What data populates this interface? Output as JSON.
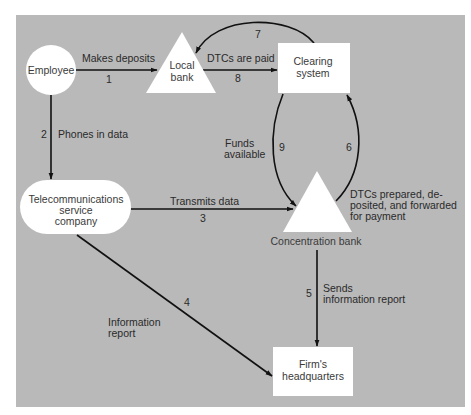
{
  "colors": {
    "panel": "#b9b9b9",
    "node_fill": "#ffffff",
    "line": "#111111",
    "text": "#2a2a2a"
  },
  "nodes": {
    "employee": {
      "label": "Employee",
      "shape": "circle"
    },
    "local_bank": {
      "label_line1": "Local",
      "label_line2": "bank",
      "shape": "triangle"
    },
    "clearing_system": {
      "label_line1": "Clearing",
      "label_line2": "system",
      "shape": "rectangle"
    },
    "telecom": {
      "label_line1": "Telecommunications",
      "label_line2": "service",
      "label_line3": "company",
      "shape": "rounded-ellipse"
    },
    "concentration_bank": {
      "label": "Concentration bank",
      "shape": "triangle"
    },
    "headquarters": {
      "label_line1": "Firm's",
      "label_line2": "headquarters",
      "shape": "rectangle"
    }
  },
  "edges": [
    {
      "id": "1",
      "number": "1",
      "from": "Employee",
      "to": "Local bank",
      "label": "Makes deposits"
    },
    {
      "id": "2",
      "number": "2",
      "from": "Employee",
      "to": "Telecommunications service company",
      "label": "Phones in data"
    },
    {
      "id": "3",
      "number": "3",
      "from": "Telecommunications service company",
      "to": "Concentration bank",
      "label": "Transmits data"
    },
    {
      "id": "4",
      "number": "4",
      "from": "Telecommunications service company",
      "to": "Firm's headquarters",
      "label_line1": "Information",
      "label_line2": "report"
    },
    {
      "id": "5",
      "number": "5",
      "from": "Concentration bank",
      "to": "Firm's headquarters",
      "label_line1": "Sends",
      "label_line2": "information report"
    },
    {
      "id": "6",
      "number": "6",
      "from": "Concentration bank",
      "to": "Clearing system",
      "label_line1": "DTCs prepared, de-",
      "label_line2": "posited, and forwarded",
      "label_line3": "for payment"
    },
    {
      "id": "7",
      "number": "7",
      "from": "Clearing system",
      "to": "Local bank",
      "label": ""
    },
    {
      "id": "8",
      "number": "8",
      "from": "Local bank",
      "to": "Clearing system",
      "label": "DTCs are paid"
    },
    {
      "id": "9",
      "number": "9",
      "from": "Clearing system",
      "to": "Concentration bank",
      "label_line1": "Funds",
      "label_line2": "available"
    }
  ]
}
